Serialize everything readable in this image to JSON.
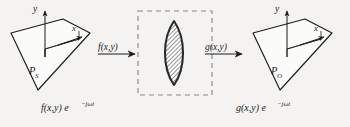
{
  "figure": {
    "background_color": "#f4f3f1",
    "ink_color": "#1c1c1c",
    "dash_color": "#8a8a8a"
  },
  "source_plane": {
    "name": "source-plane",
    "plane_label": "P",
    "plane_subscript": "S",
    "axis_y": "y",
    "axis_x": "x",
    "caption_main": "f(x,y) e",
    "caption_exponent": "−jωt"
  },
  "system_box": {
    "name": "optical-system-box",
    "border_style": "dashed",
    "aperture_shape": "lens-vesica",
    "aperture_fill": "hatched"
  },
  "arrows": {
    "input": {
      "label": "f(x,y)",
      "direction": "right"
    },
    "output": {
      "label": "g(x,y)",
      "direction": "right"
    }
  },
  "output_plane": {
    "name": "output-plane",
    "plane_label": "P",
    "plane_subscript": "O",
    "axis_y": "y",
    "axis_x": "x",
    "caption_main": "g(x,y) e",
    "caption_exponent": "−jωt"
  }
}
